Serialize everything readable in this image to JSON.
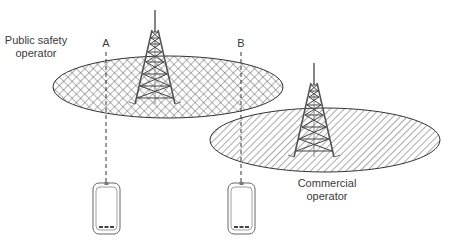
{
  "diagram": {
    "labels": {
      "public_safety_line1": "Public safety",
      "public_safety_line2": "operator",
      "commercial_line1": "Commercial",
      "commercial_line2": "operator",
      "point_a": "A",
      "point_b": "B"
    },
    "coverage_areas": [
      {
        "name": "public-safety-coverage",
        "pattern": "crosshatch",
        "cx": 168,
        "cy": 87,
        "rx": 115,
        "ry": 31
      },
      {
        "name": "commercial-coverage",
        "pattern": "diagonal-hatch",
        "cx": 325,
        "cy": 140,
        "rx": 115,
        "ry": 32
      }
    ],
    "towers": [
      {
        "name": "public-safety-tower",
        "tip_x": 155,
        "tip_y": 10,
        "base_y": 104
      },
      {
        "name": "commercial-tower",
        "tip_x": 314,
        "tip_y": 63,
        "base_y": 156
      }
    ],
    "devices": [
      {
        "name": "device-a",
        "label": "A",
        "x": 93,
        "y": 183
      },
      {
        "name": "device-b",
        "label": "B",
        "x": 228,
        "y": 183
      }
    ],
    "colors": {
      "stroke": "#333333",
      "tower": "#555555",
      "hatch": "#555555",
      "text": "#3a3a3a"
    }
  }
}
